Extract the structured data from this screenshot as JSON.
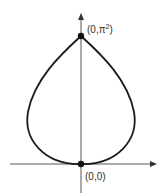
{
  "diagram": {
    "type": "parametric-curve",
    "colors": {
      "background": "#ffffff",
      "axis": "#555555",
      "curve": "#1a1a1a",
      "point": "#111111",
      "label": "#333333"
    },
    "points": [
      {
        "name": "top-point",
        "label_prefix": "(0,π",
        "label_sup": "2",
        "label_suffix": ")"
      },
      {
        "name": "origin-point",
        "label": "(0,0)"
      }
    ],
    "axes": {
      "x": {
        "direction": "right",
        "arrow": true
      },
      "y": {
        "direction": "up",
        "arrow": true
      }
    }
  }
}
